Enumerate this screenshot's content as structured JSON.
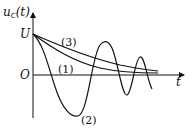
{
  "diagram": {
    "y_axis_label": "u",
    "y_axis_label_subscript": "C",
    "y_axis_label_arg": "(t)",
    "x_axis_label": "t",
    "origin_label": "O",
    "initial_value_label": "U",
    "curves": [
      {
        "id": "1",
        "label": "(1)",
        "description": "critically damped decay"
      },
      {
        "id": "2",
        "label": "(2)",
        "description": "underdamped oscillation"
      },
      {
        "id": "3",
        "label": "(3)",
        "description": "overdamped decay"
      }
    ],
    "colors": {
      "line": "#111111",
      "background": "#ffffff"
    }
  }
}
